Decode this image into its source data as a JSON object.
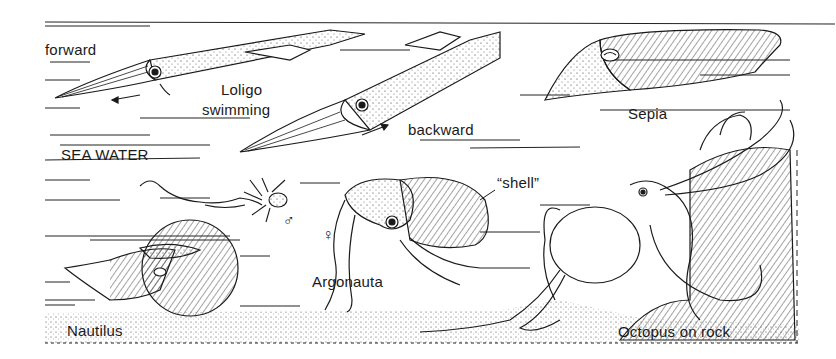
{
  "figure": {
    "background": "#ffffff",
    "ink": "#1a1a1a",
    "labels": {
      "forward": "forward",
      "loligo": "Loligo",
      "swimming": "swimming",
      "backward": "backward",
      "sepia": "Sepia",
      "sea_water": "SEA WATER",
      "shell": "“shell”",
      "argonauta": "Argonauta",
      "nautilus": "Nautilus",
      "octopus": "Octopus on rock"
    },
    "symbols": {
      "male": "♂",
      "female": "♀"
    },
    "creatures": [
      {
        "name": "Loligo (forward)"
      },
      {
        "name": "Loligo (backward)"
      },
      {
        "name": "Sepia"
      },
      {
        "name": "Argonauta male"
      },
      {
        "name": "Argonauta female"
      },
      {
        "name": "Nautilus"
      },
      {
        "name": "Octopus"
      }
    ]
  }
}
